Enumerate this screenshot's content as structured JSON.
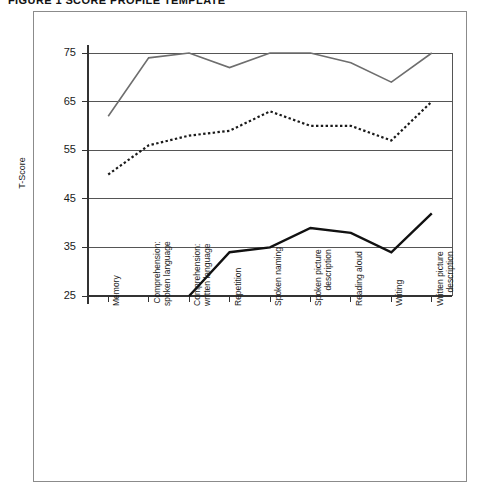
{
  "figure": {
    "title": "FIGURE 1  SCORE PROFILE TEMPLATE"
  },
  "chart_data": {
    "type": "line",
    "title": "FIGURE 1  SCORE PROFILE TEMPLATE",
    "xlabel": "",
    "ylabel": "T-Score",
    "ylim": [
      25,
      75
    ],
    "yticks": [
      25,
      35,
      45,
      55,
      65,
      75
    ],
    "ytick_labels": [
      "25",
      "35",
      "45",
      "55",
      "65",
      "75"
    ],
    "grid": true,
    "grid_axis": "y",
    "legend": null,
    "categories": [
      "Memory",
      "Comprehension:\nspoken language",
      "Comprehension:\nwritten language",
      "Repetition",
      "Spoken naming",
      "Spoken picture\ndescription",
      "Reading aloud",
      "Writing",
      "Written picture\ndescription"
    ],
    "series": [
      {
        "name": "Profile A",
        "style": "solid",
        "color": "#6e6e6e",
        "width": 1.6,
        "values": [
          62,
          74,
          75,
          72,
          75,
          75,
          73,
          69,
          75
        ]
      },
      {
        "name": "Profile B",
        "style": "dotted",
        "color": "#1a1a1a",
        "width": 2.2,
        "values": [
          50,
          56,
          58,
          59,
          63,
          60,
          60,
          57,
          65
        ]
      },
      {
        "name": "Profile C",
        "style": "solid-bold",
        "color": "#111111",
        "width": 2.4,
        "values": [
          null,
          null,
          25,
          34,
          35,
          39,
          38,
          34,
          42
        ]
      }
    ]
  }
}
